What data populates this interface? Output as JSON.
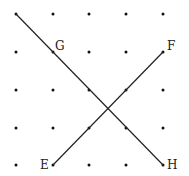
{
  "diagram": {
    "type": "dot-grid-geometry",
    "grid": {
      "columns": 5,
      "rows": 5,
      "x_positions": [
        16,
        53,
        89,
        126,
        163
      ],
      "y_positions": [
        14,
        52,
        90,
        128,
        165
      ],
      "dot_color": "#111111"
    },
    "points": [
      {
        "name": "E",
        "col": 1,
        "row": 4
      },
      {
        "name": "F",
        "col": 4,
        "row": 1
      },
      {
        "name": "G",
        "col": 1,
        "row": 1
      },
      {
        "name": "H",
        "col": 4,
        "row": 4
      }
    ],
    "labels": {
      "E": "E",
      "F": "F",
      "G": "G",
      "H": "H"
    },
    "segments": [
      {
        "name": "line-through-G-to-H",
        "from": [
          0,
          0
        ],
        "to": [
          4,
          4
        ]
      },
      {
        "name": "segment-EF",
        "from": [
          1,
          4
        ],
        "to": [
          4,
          1
        ]
      }
    ],
    "line_color": "#222222"
  }
}
